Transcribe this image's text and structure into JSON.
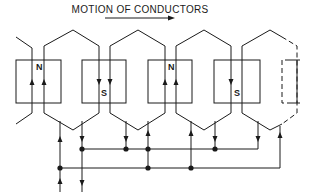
{
  "title": "MOTION OF CONDUCTORS",
  "motion_arrow": {
    "direction": "right",
    "icon": "right-arrow-icon"
  },
  "poles": [
    {
      "label": "N",
      "polarity": "north",
      "style": "solid"
    },
    {
      "label": "S",
      "polarity": "south",
      "style": "solid"
    },
    {
      "label": "N",
      "polarity": "north",
      "style": "solid"
    },
    {
      "label": "S",
      "polarity": "south",
      "style": "solid"
    },
    {
      "label": "",
      "polarity": "",
      "style": "dashed"
    }
  ],
  "coils": [
    {
      "current_left": "up",
      "current_right": "up"
    },
    {
      "current_left": "down",
      "current_right": "down"
    },
    {
      "current_left": "up",
      "current_right": "up"
    },
    {
      "current_left": "down",
      "current_right": "down"
    },
    {
      "style": "dashed"
    }
  ],
  "bus_connections": {
    "upper_bus_junctions": 5,
    "lower_bus_junctions": 4
  },
  "colors": {
    "line": "#1a1a1a",
    "background": "#ffffff"
  }
}
